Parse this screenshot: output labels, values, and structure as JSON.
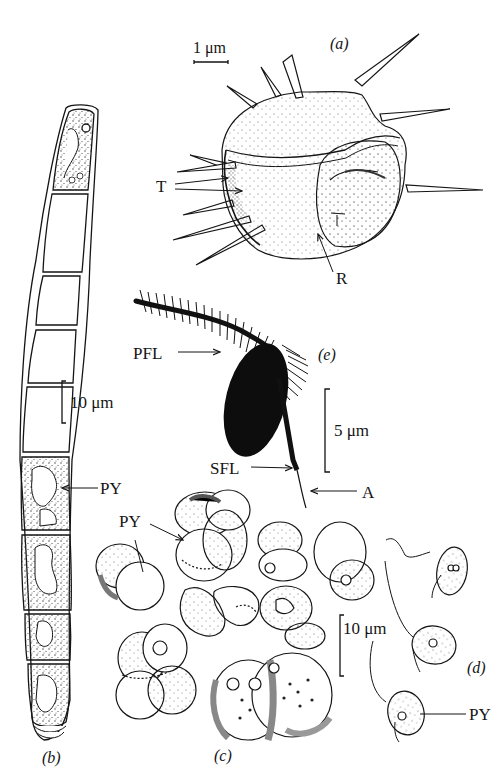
{
  "figure": {
    "panels": [
      {
        "id": "a",
        "label": "(a)",
        "scale_bar": "1 μm",
        "annotations": [
          "T",
          "R"
        ]
      },
      {
        "id": "b",
        "label": "(b)",
        "scale_bar": "10 μm",
        "annotations": [
          "PY"
        ]
      },
      {
        "id": "c",
        "label": "(c)",
        "annotations": [
          "PY"
        ]
      },
      {
        "id": "d",
        "label": "(d)",
        "scale_bar": "10 μm",
        "annotations": [
          "PY"
        ]
      },
      {
        "id": "e",
        "label": "(e)",
        "scale_bar": "5 μm",
        "annotations": [
          "PFL",
          "SFL",
          "A"
        ]
      }
    ]
  },
  "labels": {
    "a_panel": "(a)",
    "a_scale": "1 μm",
    "a_T": "T",
    "a_R": "R",
    "b_panel": "(b)",
    "b_scale": "10 μm",
    "b_PY": "PY",
    "c_panel": "(c)",
    "c_PY": "PY",
    "d_panel": "(d)",
    "d_scale": "10 μm",
    "d_PY": "PY",
    "e_panel": "(e)",
    "e_scale": "5 μm",
    "e_PFL": "PFL",
    "e_SFL": "SFL",
    "e_A": "A"
  },
  "colors": {
    "ink": "#151515",
    "background": "#ffffff",
    "stipple": "#9a9a9a"
  }
}
